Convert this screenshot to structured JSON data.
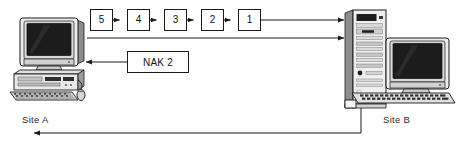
{
  "diagram": {
    "type": "network-protocol-sequence",
    "colors": {
      "line": "#1a1a1a",
      "box_border": "#1a1a1a",
      "box_fill": "#ffffff",
      "text": "#111111",
      "background": "#ffffff",
      "screen_dark": "#1c1c1c",
      "case_light": "#e9e9e9",
      "case_mid": "#b9b9b9",
      "case_dark": "#6e6e6e"
    }
  },
  "frames": {
    "label": "transmitted frame sequence",
    "items": [
      {
        "label": "5"
      },
      {
        "label": "4"
      },
      {
        "label": "3"
      },
      {
        "label": "2"
      },
      {
        "label": "1"
      }
    ]
  },
  "nak": {
    "label": "NAK 2"
  },
  "sites": {
    "a": {
      "label": "Site A",
      "device": "desktop-computer"
    },
    "b": {
      "label": "Site B",
      "device": "tower-computer"
    }
  },
  "connections": [
    {
      "name": "frame-stream-to-site-b",
      "direction": "a-to-b"
    },
    {
      "name": "second-channel-to-site-b",
      "direction": "a-to-b"
    },
    {
      "name": "nak-reply-to-site-a",
      "direction": "b-to-a"
    },
    {
      "name": "return-channel-to-site-a",
      "direction": "b-to-a"
    }
  ]
}
